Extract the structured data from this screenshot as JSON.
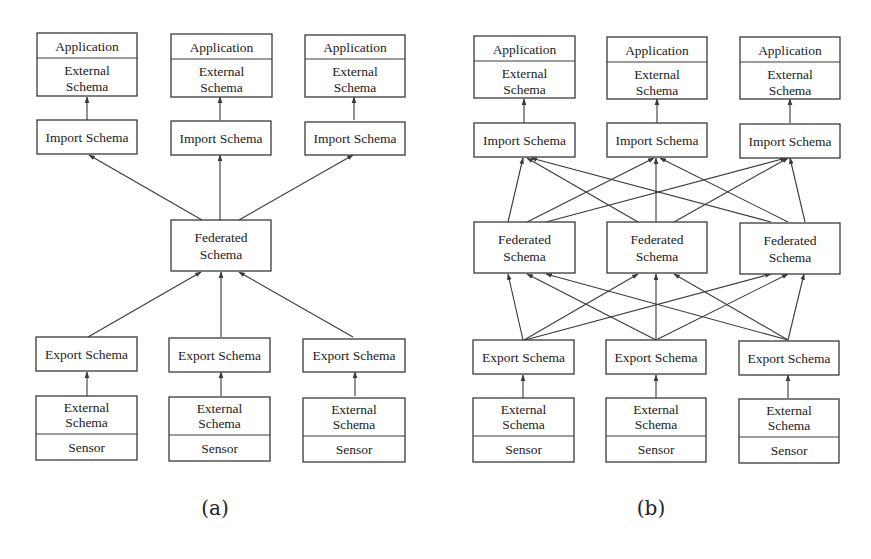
{
  "diagram_a": {
    "caption": "(a)",
    "top_boxes": [
      {
        "top_label": "Application",
        "bottom_label_1": "External",
        "bottom_label_2": "Schema"
      },
      {
        "top_label": "Application",
        "bottom_label_1": "External",
        "bottom_label_2": "Schema"
      },
      {
        "top_label": "Application",
        "bottom_label_1": "External",
        "bottom_label_2": "Schema"
      }
    ],
    "import_boxes": [
      "Import Schema",
      "Import Schema",
      "Import Schema"
    ],
    "federated_box": {
      "line_1": "Federated",
      "line_2": "Schema"
    },
    "export_boxes": [
      "Export Schema",
      "Export Schema",
      "Export Schema"
    ],
    "bottom_boxes": [
      {
        "top_label_1": "External",
        "top_label_2": "Schema",
        "bottom_label": "Sensor"
      },
      {
        "top_label_1": "External",
        "top_label_2": "Schema",
        "bottom_label": "Sensor"
      },
      {
        "top_label_1": "External",
        "top_label_2": "Schema",
        "bottom_label": "Sensor"
      }
    ],
    "edges": [
      "External/Sensor 1 -> Export Schema 1",
      "External/Sensor 2 -> Export Schema 2",
      "External/Sensor 3 -> Export Schema 3",
      "Export Schema 1 -> Federated Schema",
      "Export Schema 2 -> Federated Schema",
      "Export Schema 3 -> Federated Schema",
      "Federated Schema -> Import Schema 1",
      "Federated Schema -> Import Schema 2",
      "Federated Schema -> Import Schema 3",
      "Import Schema 1 -> Application/External 1",
      "Import Schema 2 -> Application/External 2",
      "Import Schema 3 -> Application/External 3"
    ]
  },
  "diagram_b": {
    "caption": "(b)",
    "top_boxes": [
      {
        "top_label": "Application",
        "bottom_label_1": "External",
        "bottom_label_2": "Schema"
      },
      {
        "top_label": "Application",
        "bottom_label_1": "External",
        "bottom_label_2": "Schema"
      },
      {
        "top_label": "Application",
        "bottom_label_1": "External",
        "bottom_label_2": "Schema"
      }
    ],
    "import_boxes": [
      "Import Schema",
      "Import Schema",
      "Import Schema"
    ],
    "federated_boxes": [
      {
        "line_1": "Federated",
        "line_2": "Schema"
      },
      {
        "line_1": "Federated",
        "line_2": "Schema"
      },
      {
        "line_1": "Federated",
        "line_2": "Schema"
      }
    ],
    "export_boxes": [
      "Export Schema",
      "Export Schema",
      "Export Schema"
    ],
    "bottom_boxes": [
      {
        "top_label_1": "External",
        "top_label_2": "Schema",
        "bottom_label": "Sensor"
      },
      {
        "top_label_1": "External",
        "top_label_2": "Schema",
        "bottom_label": "Sensor"
      },
      {
        "top_label_1": "External",
        "top_label_2": "Schema",
        "bottom_label": "Sensor"
      }
    ],
    "edges": [
      "External/Sensor i -> Export Schema i (i=1..3)",
      "Export Schema i -> Federated Schema j (all 9 pairs)",
      "Federated Schema i -> Import Schema j (all 9 pairs)",
      "Import Schema i -> Application/External i (i=1..3)"
    ]
  }
}
